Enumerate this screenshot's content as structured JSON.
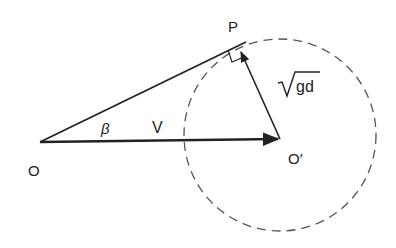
{
  "diagram": {
    "points": {
      "O": {
        "label": "O",
        "x": 40,
        "y": 142
      },
      "O_prime": {
        "label": "O′",
        "x": 280,
        "y": 139
      },
      "P": {
        "label": "P",
        "x": 238,
        "y": 45
      }
    },
    "labels": {
      "O": "O",
      "O_prime": "O′",
      "P": "P",
      "beta": "β",
      "V": "V",
      "sqrt_symbol": "√",
      "sqrt_arg": "gd"
    },
    "circle": {
      "cx": 280,
      "cy": 135,
      "r": 96,
      "style": "dashed"
    },
    "vectors": [
      {
        "name": "V",
        "from": "O",
        "to": "O_prime"
      },
      {
        "name": "sqrt(gd)",
        "from": "O_prime",
        "to": "P"
      }
    ],
    "segments": [
      {
        "from": "O",
        "to": "P",
        "note": "tangent line"
      }
    ],
    "right_angle_at": "P",
    "colors": {
      "stroke": "#222222",
      "dash": "#555555"
    }
  }
}
